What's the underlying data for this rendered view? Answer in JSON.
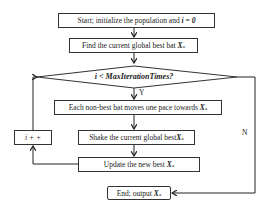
{
  "flowchart": {
    "nodes": [
      {
        "id": "start",
        "type": "process",
        "text": "Start; initialize the population and",
        "math": "i = 0"
      },
      {
        "id": "find_best",
        "type": "process",
        "text": "Find the current global best bat",
        "math": "X*"
      },
      {
        "id": "condition",
        "type": "decision",
        "text": "i < MaxIterationTimes?"
      },
      {
        "id": "move",
        "type": "process",
        "text": "Each non-best bat moves one pace towards",
        "math": "X*"
      },
      {
        "id": "shake",
        "type": "process",
        "text": "Shake the current global best",
        "math": "X*"
      },
      {
        "id": "update",
        "type": "process",
        "text": "Update the new best",
        "math": "X*"
      },
      {
        "id": "increment",
        "type": "process",
        "text": "i + +"
      },
      {
        "id": "end",
        "type": "terminal",
        "text": "End; output",
        "math": "X*"
      }
    ],
    "edges": [
      {
        "from": "start",
        "to": "find_best",
        "label": ""
      },
      {
        "from": "find_best",
        "to": "condition",
        "label": ""
      },
      {
        "from": "condition",
        "to": "move",
        "label": "Y"
      },
      {
        "from": "move",
        "to": "shake",
        "label": ""
      },
      {
        "from": "shake",
        "to": "update",
        "label": ""
      },
      {
        "from": "update",
        "to": "increment",
        "label": ""
      },
      {
        "from": "increment",
        "to": "condition",
        "label": ""
      },
      {
        "from": "condition",
        "to": "end",
        "label": "N"
      }
    ],
    "labels": {
      "yes": "Y",
      "no": "N"
    }
  }
}
